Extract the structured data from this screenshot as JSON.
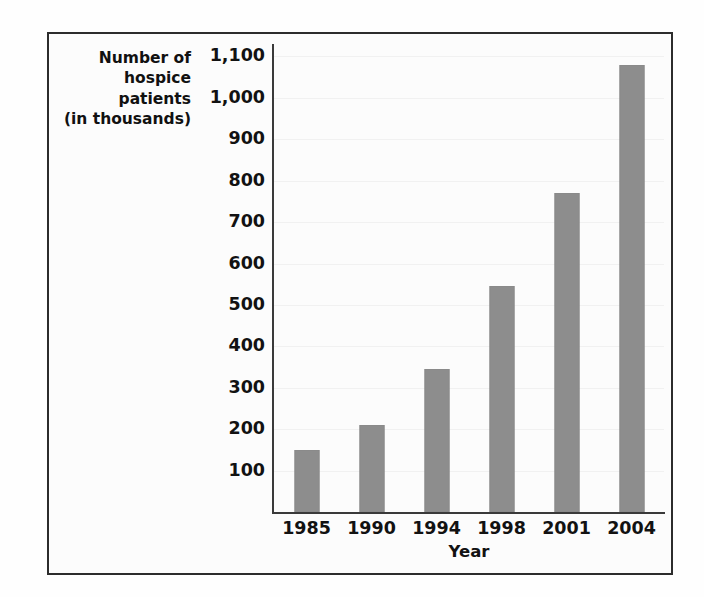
{
  "chart_data": {
    "type": "bar",
    "title": "",
    "categories": [
      "1985",
      "1990",
      "1994",
      "1998",
      "2001",
      "2004"
    ],
    "values": [
      150,
      210,
      345,
      545,
      770,
      1080
    ],
    "series": [
      {
        "name": "Number of hospice patients (in thousands)",
        "values": [
          150,
          210,
          345,
          545,
          770,
          1080
        ]
      }
    ],
    "xlabel": "Year",
    "ylabel": "Number of hospice patients (in thousands)",
    "ylabel_lines": [
      "Number of",
      "hospice",
      "patients",
      "(in thousands)"
    ],
    "ylim": [
      0,
      1130
    ],
    "yticks": [
      100,
      200,
      300,
      400,
      500,
      600,
      700,
      800,
      900,
      1000,
      1100
    ],
    "ytick_labels": [
      "100",
      "200",
      "300",
      "400",
      "500",
      "600",
      "700",
      "800",
      "900",
      "1,000",
      "1,100"
    ],
    "grid": true,
    "legend": "none",
    "bar_color": "#8d8d8d",
    "axis_color": "#3a3a3a",
    "frame_color": "#2c2c2c",
    "background_color": "#fcfcfc",
    "text_color": "#121212"
  }
}
